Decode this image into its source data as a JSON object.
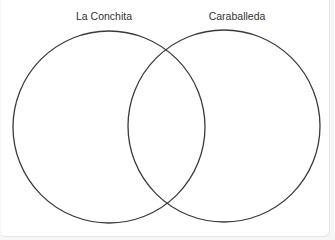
{
  "diagram": {
    "type": "venn",
    "sets": [
      {
        "label": "La Conchita",
        "center": [
          109,
          127
        ],
        "radius": 96
      },
      {
        "label": "Caraballeda",
        "center": [
          224,
          126
        ],
        "radius": 96
      }
    ],
    "colors": {
      "background": "#ffffff",
      "outline": "#3a3a3a",
      "label_text": "#333333"
    }
  }
}
